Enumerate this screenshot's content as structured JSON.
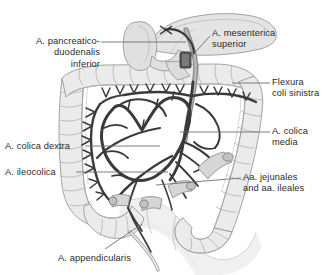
{
  "figure": {
    "background_color": "#ffffff",
    "text_color": "#2b2b2b",
    "vessel_color": "#3a3a3a",
    "organ_fill": "#e8e8e8",
    "organ_outline": "#9a9a9a",
    "leader_color": "#6e6e6e"
  },
  "labels": [
    {
      "id": "pancreaticoduodenalis-inferior",
      "lines": [
        "A. pancreatico-",
        "duodenalis",
        "inferior"
      ],
      "text": "A. pancreatico- duodenalis inferior",
      "align": "right",
      "x": 4,
      "y": 36,
      "width": 96
    },
    {
      "id": "mesenterica-superior",
      "lines": [
        "A. mesenterica",
        "superior"
      ],
      "text": "A. mesenterica superior",
      "align": "left",
      "x": 212,
      "y": 28,
      "width": 110
    },
    {
      "id": "flexura-coli-sinistra",
      "lines": [
        "Flexura",
        "coli sinistra"
      ],
      "text": "Flexura coli sinistra",
      "align": "left",
      "x": 272,
      "y": 77,
      "width": 54
    },
    {
      "id": "colica-media",
      "lines": [
        "A. colica",
        "media"
      ],
      "text": "A. colica media",
      "align": "left",
      "x": 272,
      "y": 126,
      "width": 54
    },
    {
      "id": "colica-dextra",
      "lines": [
        "A. colica dextra"
      ],
      "text": "A. colica dextra",
      "align": "left",
      "x": 5,
      "y": 141,
      "width": 80
    },
    {
      "id": "ileocolica",
      "lines": [
        "A. ileocolica"
      ],
      "text": "A. ileocolica",
      "align": "left",
      "x": 5,
      "y": 167,
      "width": 70
    },
    {
      "id": "jejunales-ileales",
      "lines": [
        "Aa. jejunales",
        "and aa. ileales"
      ],
      "text": "Aa. jejunales and aa. ileales",
      "align": "left",
      "x": 243,
      "y": 172,
      "width": 83
    },
    {
      "id": "appendicularis",
      "lines": [
        "A. appendicularis"
      ],
      "text": "A. appendicularis",
      "align": "left",
      "x": 58,
      "y": 253,
      "width": 92
    }
  ],
  "structures": [
    {
      "id": "pancreas",
      "name": "pancreas"
    },
    {
      "id": "duodenum",
      "name": "duodenum"
    },
    {
      "id": "transverse-colon",
      "name": "transverse colon"
    },
    {
      "id": "ascending-colon",
      "name": "ascending colon"
    },
    {
      "id": "descending-colon",
      "name": "descending colon"
    },
    {
      "id": "sigmoid-colon",
      "name": "sigmoid colon"
    },
    {
      "id": "cecum",
      "name": "cecum"
    },
    {
      "id": "appendix",
      "name": "vermiform appendix"
    },
    {
      "id": "small-bowel-loop",
      "name": "small bowel loop"
    },
    {
      "id": "marginal-arcade",
      "name": "marginal artery arcade"
    },
    {
      "id": "vasa-recta",
      "name": "vasa recta"
    },
    {
      "id": "sma-trunk",
      "name": "superior mesenteric artery trunk"
    }
  ]
}
